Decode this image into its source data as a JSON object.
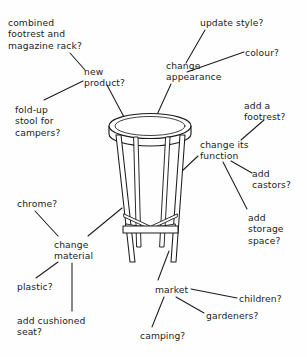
{
  "diagram": {
    "type": "mind-map",
    "central_image": "bar-stool-line-drawing",
    "ink_color": "#1c1c1c",
    "background_color": "#fefefe",
    "nodes": [
      {
        "id": "combined-footrest",
        "text": "combined\nfootrest and\nmagazine rack?",
        "x": 8,
        "y": 17,
        "align": "left"
      },
      {
        "id": "new-product",
        "text": "new\nproduct?",
        "x": 84,
        "y": 66,
        "align": "left"
      },
      {
        "id": "fold-up-stool",
        "text": "fold-up\nstool for\ncampers?",
        "x": 15,
        "y": 104,
        "align": "left"
      },
      {
        "id": "update-style",
        "text": "update style?",
        "x": 200,
        "y": 17,
        "align": "left"
      },
      {
        "id": "colour",
        "text": "colour?",
        "x": 245,
        "y": 47,
        "align": "left"
      },
      {
        "id": "change-appearance",
        "text": "change\nappearance",
        "x": 166,
        "y": 60,
        "align": "left"
      },
      {
        "id": "add-a-footrest",
        "text": "add a\nfootrest?",
        "x": 244,
        "y": 100,
        "align": "left"
      },
      {
        "id": "change-its-function",
        "text": "change its\nfunction",
        "x": 200,
        "y": 139,
        "align": "left"
      },
      {
        "id": "add-castors",
        "text": "add\ncastors?",
        "x": 252,
        "y": 168,
        "align": "left"
      },
      {
        "id": "add-storage-space",
        "text": "add\nstorage\nspace?",
        "x": 248,
        "y": 212,
        "align": "left"
      },
      {
        "id": "chrome",
        "text": "chrome?",
        "x": 17,
        "y": 198,
        "align": "left"
      },
      {
        "id": "change-material",
        "text": "change\nmaterial",
        "x": 54,
        "y": 239,
        "align": "left"
      },
      {
        "id": "plastic",
        "text": "plastic?",
        "x": 17,
        "y": 281,
        "align": "left"
      },
      {
        "id": "add-cushioned-seat",
        "text": "add cushioned\nseat?",
        "x": 17,
        "y": 315,
        "align": "left"
      },
      {
        "id": "market",
        "text": "market",
        "x": 155,
        "y": 284,
        "align": "left"
      },
      {
        "id": "camping",
        "text": "camping?",
        "x": 140,
        "y": 330,
        "align": "left"
      },
      {
        "id": "gardeners",
        "text": "gardeners?",
        "x": 206,
        "y": 310,
        "align": "left"
      },
      {
        "id": "children",
        "text": "children?",
        "x": 239,
        "y": 293,
        "align": "left"
      }
    ],
    "connectors": [
      {
        "id": "combined-footrest--new-product",
        "from": "combined-footrest",
        "to": "new-product",
        "x1": 70,
        "y1": 53,
        "x2": 85,
        "y2": 70
      },
      {
        "id": "new-product--fold-up-stool",
        "from": "new-product",
        "to": "fold-up-stool",
        "x1": 83,
        "y1": 81,
        "x2": 44,
        "y2": 100
      },
      {
        "id": "new-product--stool",
        "from": "new-product",
        "to": "stool-seat",
        "x1": 107,
        "y1": 85,
        "x2": 122,
        "y2": 116
      },
      {
        "id": "update-style--change-appearance",
        "from": "update-style",
        "to": "change-appearance",
        "x1": 205,
        "y1": 30,
        "x2": 187,
        "y2": 62
      },
      {
        "id": "colour--change-appearance",
        "from": "colour",
        "to": "change-appearance",
        "x1": 244,
        "y1": 53,
        "x2": 188,
        "y2": 72
      },
      {
        "id": "change-appearance--stool",
        "from": "change-appearance",
        "to": "stool-seat",
        "x1": 171,
        "y1": 84,
        "x2": 155,
        "y2": 116
      },
      {
        "id": "add-a-footrest--change-its-function",
        "from": "add-a-footrest",
        "to": "change-its-function",
        "x1": 263,
        "y1": 120,
        "x2": 240,
        "y2": 140
      },
      {
        "id": "change-its-function--stool",
        "from": "change-its-function",
        "to": "stool-leg-right",
        "x1": 198,
        "y1": 155,
        "x2": 180,
        "y2": 172
      },
      {
        "id": "change-its-function--add-castors",
        "from": "change-its-function",
        "to": "add-castors",
        "x1": 232,
        "y1": 161,
        "x2": 252,
        "y2": 172
      },
      {
        "id": "change-its-function--add-storage",
        "from": "change-its-function",
        "to": "add-storage-space",
        "x1": 224,
        "y1": 162,
        "x2": 248,
        "y2": 208
      },
      {
        "id": "chrome--change-material",
        "from": "chrome",
        "to": "change-material",
        "x1": 35,
        "y1": 211,
        "x2": 57,
        "y2": 236
      },
      {
        "id": "change-material--stool",
        "from": "change-material",
        "to": "stool-leg-left",
        "x1": 88,
        "y1": 236,
        "x2": 121,
        "y2": 208
      },
      {
        "id": "change-material--plastic",
        "from": "change-material",
        "to": "plastic",
        "x1": 58,
        "y1": 262,
        "x2": 36,
        "y2": 278
      },
      {
        "id": "change-material--add-cushioned",
        "from": "change-material",
        "to": "add-cushioned-seat",
        "x1": 72,
        "y1": 263,
        "x2": 72,
        "y2": 311
      },
      {
        "id": "stool--market",
        "from": "stool-leg-base",
        "to": "market",
        "x1": 169,
        "y1": 251,
        "x2": 158,
        "y2": 280
      },
      {
        "id": "market--camping",
        "from": "market",
        "to": "camping",
        "x1": 164,
        "y1": 296,
        "x2": 152,
        "y2": 327
      },
      {
        "id": "market--gardeners",
        "from": "market",
        "to": "gardeners",
        "x1": 176,
        "y1": 296,
        "x2": 204,
        "y2": 312
      },
      {
        "id": "market--children",
        "from": "market",
        "to": "children",
        "x1": 190,
        "y1": 289,
        "x2": 237,
        "y2": 298
      }
    ]
  }
}
